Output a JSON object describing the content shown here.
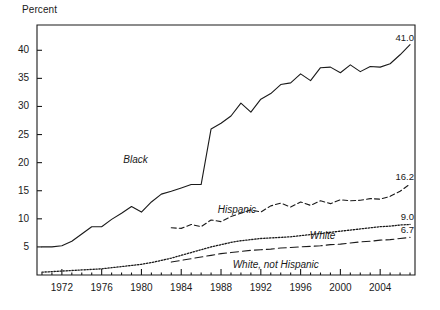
{
  "chart_data": {
    "type": "line",
    "title": "",
    "xlabel": "",
    "ylabel": "Percent",
    "ylim": [
      0,
      44.5
    ],
    "xlim": [
      1969.5,
      2007.5
    ],
    "grid": false,
    "legend_position": "inline-labels",
    "ytick_labels": [
      "5",
      "10",
      "15",
      "20",
      "25",
      "30",
      "35",
      "40"
    ],
    "ytick_values": [
      5,
      10,
      15,
      20,
      25,
      30,
      35,
      40
    ],
    "xtick_labels": [
      "1972",
      "1976",
      "1980",
      "1984",
      "1988",
      "1992",
      "1996",
      "2000",
      "2004"
    ],
    "xtick_values": [
      1972,
      1976,
      1980,
      1984,
      1988,
      1992,
      1996,
      2000,
      2004
    ],
    "x": [
      1970,
      1971,
      1972,
      1973,
      1974,
      1975,
      1976,
      1977,
      1978,
      1979,
      1980,
      1981,
      1982,
      1983,
      1984,
      1985,
      1986,
      1987,
      1988,
      1989,
      1990,
      1991,
      1992,
      1993,
      1994,
      1995,
      1996,
      1997,
      1998,
      1999,
      2000,
      2001,
      2002,
      2003,
      2004,
      2005,
      2006,
      2007
    ],
    "series": [
      {
        "name": "Black",
        "style": "solid",
        "end_value": 41.0,
        "end_label": "41.0",
        "values": [
          5.0,
          5.0,
          5.2,
          6.0,
          7.3,
          8.6,
          8.6,
          9.9,
          11.0,
          12.2,
          11.2,
          13.0,
          14.4,
          14.9,
          15.5,
          16.1,
          16.1,
          26.0,
          27.0,
          28.3,
          30.6,
          29.0,
          31.3,
          32.3,
          33.9,
          34.2,
          35.8,
          34.6,
          36.9,
          37.0,
          36.0,
          37.4,
          36.2,
          37.1,
          37.0,
          37.6,
          39.2,
          41.0
        ]
      },
      {
        "name": "Hispanic",
        "style": "dashed",
        "end_value": 16.2,
        "end_label": "16.2",
        "values": [
          null,
          null,
          null,
          null,
          null,
          null,
          null,
          null,
          null,
          null,
          null,
          null,
          null,
          8.4,
          8.3,
          9.0,
          8.6,
          9.8,
          9.5,
          10.4,
          11.0,
          11.6,
          11.2,
          12.3,
          12.8,
          12.1,
          13.0,
          12.4,
          13.2,
          12.7,
          13.4,
          13.2,
          13.3,
          13.6,
          13.5,
          14.0,
          14.9,
          16.2
        ]
      },
      {
        "name": "White",
        "style": "dotted",
        "end_value": 9.0,
        "end_label": "9.0",
        "values": [
          0.5,
          0.6,
          0.7,
          0.8,
          0.9,
          1.0,
          1.1,
          1.3,
          1.5,
          1.7,
          1.9,
          2.2,
          2.6,
          3.0,
          3.5,
          4.0,
          4.5,
          5.0,
          5.4,
          5.8,
          6.1,
          6.3,
          6.5,
          6.6,
          6.7,
          6.8,
          7.0,
          7.2,
          7.4,
          7.6,
          7.8,
          8.0,
          8.2,
          8.4,
          8.6,
          8.7,
          8.9,
          9.0
        ]
      },
      {
        "name": "White, not Hispanic",
        "style": "longdash",
        "end_value": 6.7,
        "end_label": "6.7",
        "values": [
          null,
          null,
          null,
          null,
          null,
          null,
          null,
          null,
          null,
          null,
          null,
          null,
          null,
          2.3,
          2.6,
          2.9,
          3.2,
          3.5,
          3.8,
          4.0,
          4.2,
          4.4,
          4.5,
          4.6,
          4.8,
          4.9,
          5.0,
          5.1,
          5.2,
          5.4,
          5.5,
          5.7,
          5.9,
          6.0,
          6.2,
          6.3,
          6.5,
          6.7
        ]
      }
    ],
    "annotations": [
      {
        "text": "Black",
        "x": 1979.4,
        "y": 20.5
      },
      {
        "text": "Hispanic",
        "x": 1989.6,
        "y": 11.5
      },
      {
        "text": "White",
        "x": 1998.2,
        "y": 7.0
      },
      {
        "text": "White, not Hispanic",
        "x": 1993.5,
        "y": 1.8
      }
    ],
    "colors": {
      "line": "#1a1a1a",
      "axis": "#1a1a1a",
      "background": "#ffffff"
    }
  }
}
